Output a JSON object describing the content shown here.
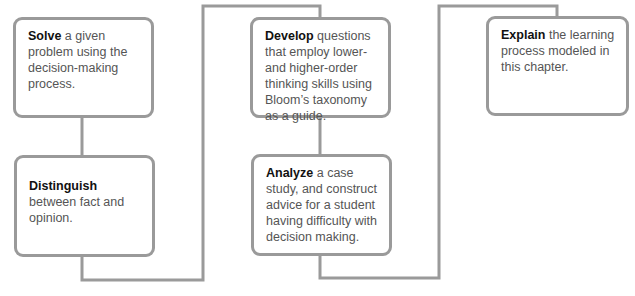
{
  "diagram": {
    "title": "",
    "line_color": "#9a9a9a",
    "objectives": [
      {
        "verb": "Solve",
        "rest": " a given problem using the decision-making process."
      },
      {
        "verb": "Distinguish",
        "rest": " between fact and opinion."
      },
      {
        "verb": "Develop",
        "rest": " questions that employ lower- and higher-order thinking skills using Bloom’s taxonomy as a guide."
      },
      {
        "verb": "Analyze",
        "rest": " a case study, and construct advice for a student having difficulty with decision making."
      },
      {
        "verb": "Explain",
        "rest": " the learning process modeled in this chapter."
      }
    ]
  }
}
